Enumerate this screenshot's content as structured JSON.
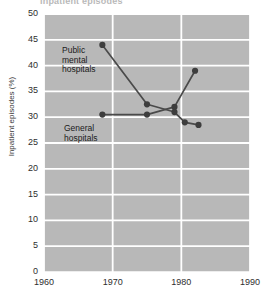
{
  "title": "Inpatient episodes",
  "axes": {
    "ylabel": "Inpatient episodes (%)",
    "yticks": [
      "0",
      "5",
      "10",
      "15",
      "20",
      "25",
      "30",
      "35",
      "40",
      "45",
      "50"
    ],
    "xticks": [
      "1960",
      "1970",
      "1980",
      "1990"
    ]
  },
  "annotations": {
    "public_line1": "Public",
    "public_line2": "mental",
    "public_line3": "hospitals",
    "general_line1": "General",
    "general_line2": "hospitals"
  },
  "colors": {
    "plot_background": "#b8b8b8",
    "gridline": "#ffffff",
    "series": "#4a4a4a",
    "marker": "#3d3d3d",
    "text": "#2e2e2e"
  },
  "chart_data": {
    "type": "line",
    "title": "Inpatient episodes",
    "xlabel": "",
    "ylabel": "Inpatient episodes (%)",
    "xlim": [
      1960,
      1990
    ],
    "ylim": [
      0,
      50
    ],
    "xticks": [
      1960,
      1970,
      1980,
      1990
    ],
    "yticks": [
      0,
      5,
      10,
      15,
      20,
      25,
      30,
      35,
      40,
      45,
      50
    ],
    "grid": true,
    "legend": "inline-annotations",
    "series": [
      {
        "name": "Public mental hospitals",
        "x": [
          1968.5,
          1975.0,
          1979.0,
          1980.5,
          1982.5
        ],
        "values": [
          44.0,
          32.5,
          31.0,
          29.0,
          28.5
        ]
      },
      {
        "name": "General hospitals",
        "x": [
          1968.5,
          1975.0,
          1979.0,
          1982.0
        ],
        "values": [
          30.5,
          30.5,
          32.0,
          39.0
        ]
      }
    ]
  }
}
